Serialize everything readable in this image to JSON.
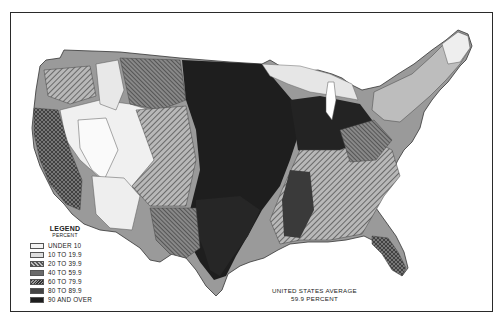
{
  "map": {
    "subject": "United States county choropleth",
    "legend": {
      "title": "LEGEND",
      "subtitle": "PERCENT",
      "classes": [
        {
          "label": "UNDER 10",
          "color": "#f4f4f4",
          "pattern": "blank"
        },
        {
          "label": "10 TO 19.9",
          "color": "#dedede",
          "pattern": "light"
        },
        {
          "label": "20 TO 39.9",
          "color": "#9a9a9a",
          "pattern": "diagonal"
        },
        {
          "label": "40 TO 59.9",
          "color": "#6e6e6e",
          "pattern": "crosshatch"
        },
        {
          "label": "60 TO 79.9",
          "color": "#8a8a8a",
          "pattern": "fine-diagonal"
        },
        {
          "label": "80 TO 89.9",
          "color": "#444444",
          "pattern": "dense"
        },
        {
          "label": "90 AND OVER",
          "color": "#1e1e1e",
          "pattern": "solid"
        }
      ]
    },
    "note": {
      "line1": "UNITED STATES AVERAGE",
      "line2": "59.9 PERCENT"
    }
  }
}
